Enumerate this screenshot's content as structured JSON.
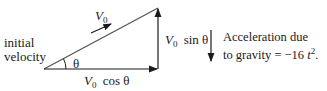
{
  "diagram": {
    "type": "velocity-vector-triangle",
    "labels": {
      "hypotenuse": {
        "symbol": "V",
        "subscript": "0"
      },
      "initial_velocity": [
        "initial",
        "velocity"
      ],
      "angle": "θ",
      "horizontal": {
        "symbol": "V",
        "subscript": "0",
        "rest": "cos θ"
      },
      "vertical": {
        "symbol": "V",
        "subscript": "0",
        "rest": "sin θ"
      },
      "gravity_note": {
        "line1": "Acceleration due",
        "line2_prefix": "to gravity = −16 ",
        "line2_var": "t",
        "line2_exp": "2",
        "line2_suffix": "."
      }
    },
    "colors": {
      "stroke": "#1a1a1a",
      "background": "#ffffff"
    }
  }
}
